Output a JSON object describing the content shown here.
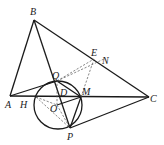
{
  "figure": {
    "labels": {
      "B": "B",
      "A": "A",
      "C": "C",
      "Q": "Q",
      "E": "E",
      "N": "N",
      "H": "H",
      "D": "D",
      "M": "M",
      "O": "O",
      "P": "P"
    },
    "points": {
      "A": [
        10,
        96
      ],
      "B": [
        34,
        20
      ],
      "C": [
        149,
        97
      ],
      "Q": [
        57,
        81
      ],
      "M": [
        81,
        97
      ],
      "P": [
        70,
        128
      ],
      "E": [
        94,
        59
      ],
      "N": [
        104,
        59
      ],
      "H": [
        36,
        97
      ],
      "O": [
        57,
        105
      ],
      "D": [
        61,
        97
      ]
    },
    "circle": {
      "center": [
        58,
        105
      ],
      "radius": 24
    }
  }
}
